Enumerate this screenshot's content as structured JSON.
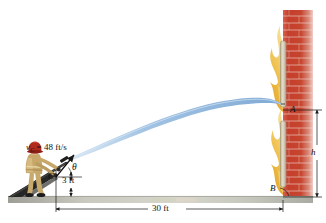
{
  "figure": {
    "labels": {
      "velocity_symbol": "v",
      "velocity_subscript": "C",
      "velocity_equals": " = 48 ft/s",
      "velocity_full": "v_C = 48 ft/s",
      "angle": "θ",
      "point_c": "C",
      "height_c": "3 ft",
      "horizontal_distance": "30 ft",
      "point_a": "A",
      "point_b": "B",
      "height_h": "h"
    },
    "values": {
      "initial_speed": 48,
      "speed_units": "ft/s",
      "nozzle_height": 3,
      "nozzle_height_units": "ft",
      "horizontal_range": 30,
      "range_units": "ft",
      "wall_height_symbol": "h",
      "launch_angle_symbol": "θ"
    },
    "colors": {
      "water_stream": "#8cb4de",
      "brick": "#c8402e",
      "brick_light": "#e08878",
      "mortar": "#f0ded6",
      "flame": "#e8a62a",
      "flame_light": "#f2cf6a",
      "ground": "#b8b8b0",
      "coat": "#c8a86a",
      "helmet": "#b02a1e",
      "hose": "#3a3a3a",
      "dimension_line": "#1a1a1a",
      "window_frame": "#cfc8b4"
    },
    "elements": {
      "person": "firefighter-figure",
      "stream": "water-stream-trajectory",
      "wall": "burning-building-wall",
      "windows": 2,
      "flames": 2,
      "ground": "ground-strip",
      "ramp": "ground-wedge"
    }
  }
}
